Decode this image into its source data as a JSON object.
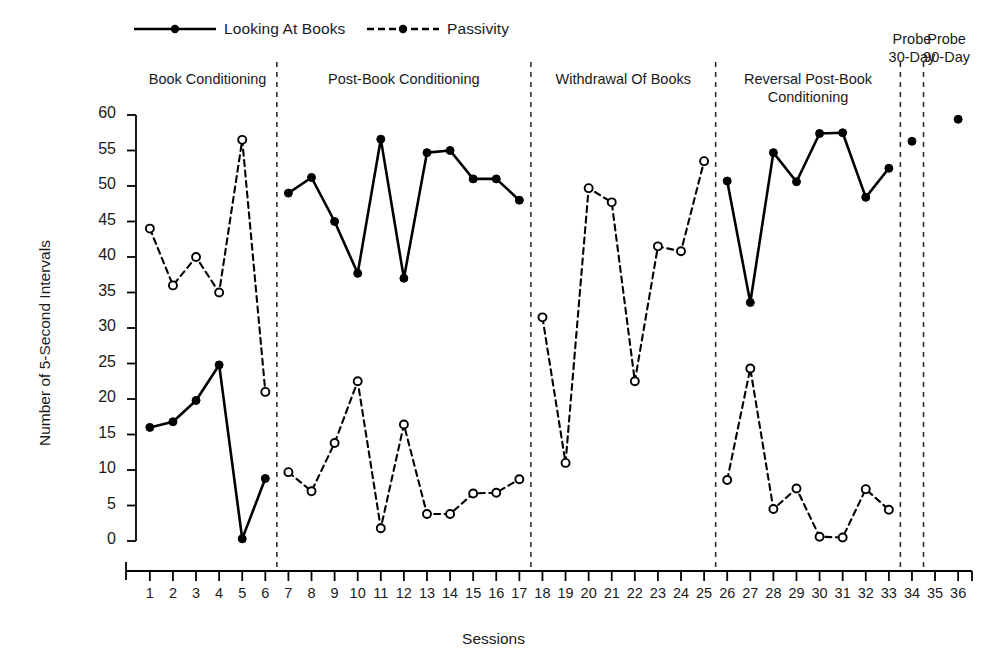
{
  "legend": {
    "items": [
      {
        "name": "Looking At Books",
        "style": "solid",
        "marker": "filled-circle"
      },
      {
        "name": "Passivity",
        "style": "dashed",
        "marker": "filled-circle"
      }
    ]
  },
  "phases": [
    {
      "label": "Book Conditioning",
      "start": 1,
      "end": 6
    },
    {
      "label": "Post-Book Conditioning",
      "start": 7,
      "end": 17
    },
    {
      "label": "Withdrawal Of Books",
      "start": 18,
      "end": 25
    },
    {
      "label": "Reversal Post-Book\nConditioning",
      "start": 26,
      "end": 33
    },
    {
      "label": "Probe\n30-Day",
      "start": 34,
      "end": 34
    },
    {
      "label": "Probe\n90-Day",
      "start": 35,
      "end": 36
    }
  ],
  "chart_data": {
    "type": "line",
    "title": "",
    "xlabel": "Sessions",
    "ylabel": "Number of 5-Second Intervals",
    "xlim": [
      0.4,
      36.6
    ],
    "ylim": [
      0,
      60
    ],
    "yticks": [
      0,
      5,
      10,
      15,
      20,
      25,
      30,
      35,
      40,
      45,
      50,
      55,
      60
    ],
    "xticks": [
      1,
      2,
      3,
      4,
      5,
      6,
      7,
      8,
      9,
      10,
      11,
      12,
      13,
      14,
      15,
      16,
      17,
      18,
      19,
      20,
      21,
      22,
      23,
      24,
      25,
      26,
      27,
      28,
      29,
      30,
      31,
      32,
      33,
      34,
      35,
      36
    ],
    "grid": false,
    "legend_position": "top",
    "x": [
      1,
      2,
      3,
      4,
      5,
      6,
      7,
      8,
      9,
      10,
      11,
      12,
      13,
      14,
      15,
      16,
      17,
      18,
      19,
      20,
      21,
      22,
      23,
      24,
      25,
      26,
      27,
      28,
      29,
      30,
      31,
      32,
      33,
      34,
      35,
      36
    ],
    "series": [
      {
        "name": "Looking At Books",
        "style": "solid",
        "marker": "filled-circle",
        "segments": [
          {
            "x": [
              1,
              2,
              3,
              4,
              5,
              6
            ],
            "values": [
              16,
              16.8,
              19.8,
              24.8,
              0.3,
              8.8
            ]
          },
          {
            "x": [
              7,
              8,
              9,
              10,
              11,
              12,
              13,
              14,
              15,
              16,
              17
            ],
            "values": [
              49,
              51.2,
              45,
              37.7,
              56.6,
              37,
              54.7,
              55,
              51,
              51,
              48
            ]
          },
          {
            "x": [
              26,
              27,
              28,
              29,
              30,
              31,
              32,
              33
            ],
            "values": [
              50.7,
              33.6,
              54.7,
              50.6,
              57.4,
              57.5,
              48.4,
              52.5
            ]
          },
          {
            "x": [
              34
            ],
            "values": [
              56.3
            ]
          },
          {
            "x": [
              36
            ],
            "values": [
              59.4
            ]
          }
        ]
      },
      {
        "name": "Passivity",
        "style": "dashed",
        "marker": "open-circle",
        "segments": [
          {
            "x": [
              1,
              2,
              3,
              4,
              5,
              6
            ],
            "values": [
              44,
              36,
              40,
              35,
              56.5,
              21
            ]
          },
          {
            "x": [
              7,
              8,
              9,
              10,
              11,
              12,
              13,
              14,
              15,
              16,
              17
            ],
            "values": [
              9.7,
              7,
              13.8,
              22.5,
              1.8,
              16.4,
              3.8,
              3.8,
              6.7,
              6.8,
              8.7
            ]
          },
          {
            "x": [
              18,
              19,
              20,
              21,
              22,
              23,
              24,
              25
            ],
            "values": [
              31.5,
              11,
              49.7,
              47.7,
              22.5,
              41.5,
              40.8,
              53.5
            ]
          },
          {
            "x": [
              26,
              27,
              28,
              29,
              30,
              31,
              32,
              33
            ],
            "values": [
              8.6,
              24.3,
              4.5,
              7.4,
              0.6,
              0.5,
              7.3,
              4.4
            ]
          }
        ]
      }
    ],
    "dividers": [
      6.5,
      17.5,
      25.5,
      33.5,
      34.5
    ],
    "colors": {
      "line": "#000000",
      "marker_fill": "#000000",
      "marker_open": "#ffffff",
      "axis": "#000000"
    }
  }
}
